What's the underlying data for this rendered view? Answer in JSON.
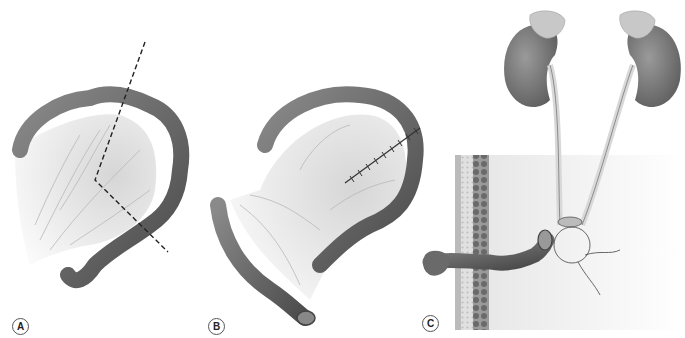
{
  "figure": {
    "panels": [
      {
        "id": "A",
        "label": "A",
        "description": "Colon segment with mesentery and dashed resection lines"
      },
      {
        "id": "B",
        "label": "B",
        "description": "Isolated colon conduit with sutured mesentery"
      },
      {
        "id": "C",
        "label": "C",
        "description": "Kidneys with ureters anastomosed to colon conduit exiting abdominal wall as stoma"
      }
    ],
    "colors": {
      "bowel_dark": "#5a5a5a",
      "bowel_light": "#9a9a9a",
      "mesentery": "#e6e6e6",
      "kidney": "#7a7a7a",
      "adrenal": "#c8c8c8",
      "ureter": "#d8d8d8",
      "background_field": "#ececec"
    }
  }
}
